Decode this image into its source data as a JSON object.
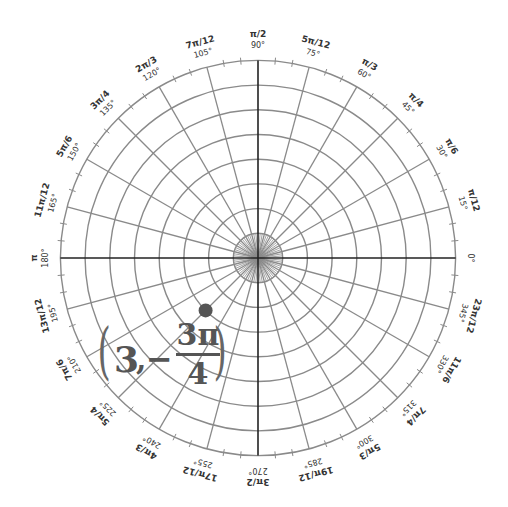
{
  "chart_data": {
    "type": "polar-grid",
    "title": "",
    "center": [
      258,
      258
    ],
    "ring_count": 8,
    "ring_spacing_px": 24.7,
    "spoke_step_deg": 15,
    "rim_tick_step_deg": 5,
    "angle_labels": [
      {
        "deg": 0,
        "degree_label": "0°",
        "radian_label": ""
      },
      {
        "deg": 15,
        "degree_label": "15°",
        "radian_label": "π/12"
      },
      {
        "deg": 30,
        "degree_label": "30°",
        "radian_label": "π/6"
      },
      {
        "deg": 45,
        "degree_label": "45°",
        "radian_label": "π/4"
      },
      {
        "deg": 60,
        "degree_label": "60°",
        "radian_label": "π/3"
      },
      {
        "deg": 75,
        "degree_label": "75°",
        "radian_label": "5π/12"
      },
      {
        "deg": 90,
        "degree_label": "90°",
        "radian_label": "π/2"
      },
      {
        "deg": 105,
        "degree_label": "105°",
        "radian_label": "7π/12"
      },
      {
        "deg": 120,
        "degree_label": "120°",
        "radian_label": "2π/3"
      },
      {
        "deg": 135,
        "degree_label": "135°",
        "radian_label": "3π/4"
      },
      {
        "deg": 150,
        "degree_label": "150°",
        "radian_label": "5π/6"
      },
      {
        "deg": 165,
        "degree_label": "165°",
        "radian_label": "11π/12"
      },
      {
        "deg": 180,
        "degree_label": "180°",
        "radian_label": "π"
      },
      {
        "deg": 195,
        "degree_label": "195°",
        "radian_label": "13π/12"
      },
      {
        "deg": 210,
        "degree_label": "210°",
        "radian_label": "7π/6"
      },
      {
        "deg": 225,
        "degree_label": "225°",
        "radian_label": "5π/4"
      },
      {
        "deg": 240,
        "degree_label": "240°",
        "radian_label": "4π/3"
      },
      {
        "deg": 255,
        "degree_label": "255°",
        "radian_label": "17π/12"
      },
      {
        "deg": 270,
        "degree_label": "270°",
        "radian_label": "3π/2"
      },
      {
        "deg": 285,
        "degree_label": "285°",
        "radian_label": "19π/12"
      },
      {
        "deg": 300,
        "degree_label": "300°",
        "radian_label": "5π/3"
      },
      {
        "deg": 315,
        "degree_label": "315°",
        "radian_label": "7π/4"
      },
      {
        "deg": 330,
        "degree_label": "330°",
        "radian_label": "11π/6"
      },
      {
        "deg": 345,
        "degree_label": "345°",
        "radian_label": "23π/12"
      }
    ],
    "points": [
      {
        "r": 3,
        "theta_label": "-3π/4",
        "theta_deg": -135,
        "color": "#555555"
      }
    ]
  },
  "annotation": {
    "r_text": "3",
    "comma": ",",
    "minus": "−",
    "numerator": "3π",
    "denominator": "4",
    "open_paren": "(",
    "close_paren": ")"
  },
  "colors": {
    "grid": "#8a8a8a",
    "axis": "#222222",
    "point": "#555555",
    "text": "#333333"
  }
}
